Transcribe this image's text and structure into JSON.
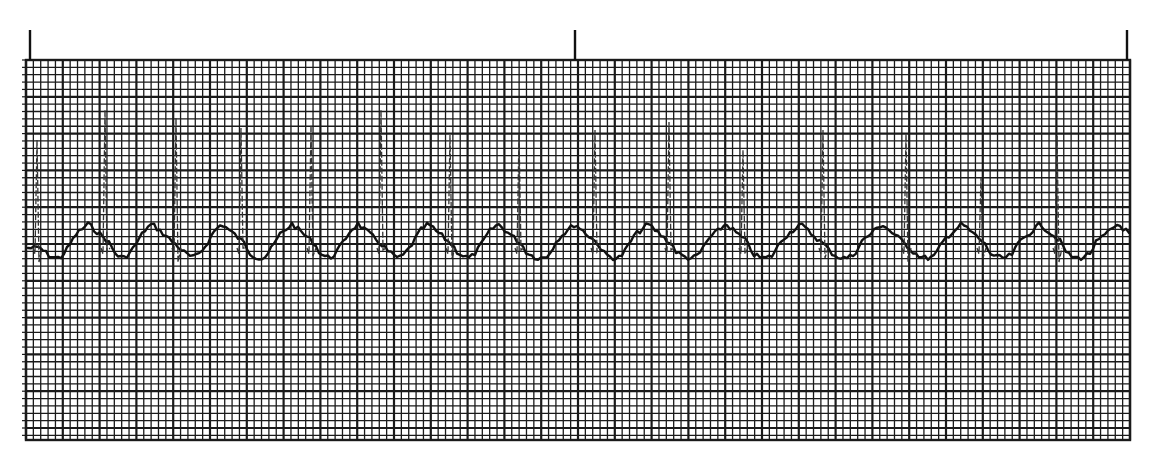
{
  "chart_data": {
    "type": "line",
    "title": "",
    "subtitle": "",
    "xlabel": "",
    "ylabel": "",
    "grid": {
      "on": true,
      "left_px": 26,
      "right_px": 1130,
      "top_px": 60,
      "bottom_px": 440,
      "small_square_px": 7.36,
      "major_every_small": 5,
      "line_color": "#1a1a1a",
      "background": "#ffffff"
    },
    "time_markers_x_px": [
      30,
      575,
      1127
    ],
    "baseline_y_px": 248,
    "trace_color": "#111111",
    "r_peaks": [
      {
        "x": 36,
        "peak_y": 140,
        "s_y": 262
      },
      {
        "x": 104,
        "peak_y": 110,
        "s_y": 252
      },
      {
        "x": 175,
        "peak_y": 118,
        "s_y": 262
      },
      {
        "x": 240,
        "peak_y": 128,
        "s_y": 248
      },
      {
        "x": 310,
        "peak_y": 125,
        "s_y": 256
      },
      {
        "x": 380,
        "peak_y": 110,
        "s_y": 250
      },
      {
        "x": 449,
        "peak_y": 135,
        "s_y": 258
      },
      {
        "x": 518,
        "peak_y": 134,
        "s_y": 250
      },
      {
        "x": 594,
        "peak_y": 130,
        "s_y": 252
      },
      {
        "x": 668,
        "peak_y": 122,
        "s_y": 250
      },
      {
        "x": 742,
        "peak_y": 150,
        "s_y": 254
      },
      {
        "x": 822,
        "peak_y": 130,
        "s_y": 258
      },
      {
        "x": 905,
        "peak_y": 134,
        "s_y": 262
      },
      {
        "x": 980,
        "peak_y": 178,
        "s_y": 258
      },
      {
        "x": 1056,
        "peak_y": 136,
        "s_y": 262
      }
    ],
    "t_wave_peaks_x_px": [
      88,
      152,
      222,
      292,
      358,
      428,
      498,
      575,
      648,
      726,
      800,
      882,
      962,
      1040,
      1118
    ],
    "heart_rate_note": "Regular rhythm, R-R interval approx. 70-80 px (~9.5-11 small squares)"
  }
}
